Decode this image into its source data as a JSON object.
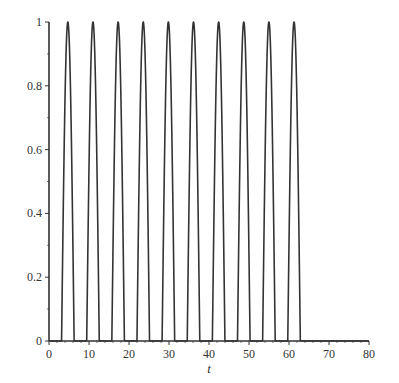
{
  "chart_data": {
    "type": "line",
    "title": "",
    "xlabel": "t",
    "ylabel": "",
    "xlim": [
      0,
      80
    ],
    "ylim": [
      0,
      1
    ],
    "x_ticks": [
      0,
      10,
      20,
      30,
      40,
      50,
      60,
      70,
      80
    ],
    "x_tick_labels": [
      "0",
      "10",
      "20",
      "30",
      "40",
      "50",
      "60",
      "70",
      "80"
    ],
    "y_ticks": [
      0,
      0.2,
      0.4,
      0.6,
      0.8,
      1
    ],
    "y_tick_labels": [
      "0",
      "0.2",
      "0.4",
      "0.6",
      "0.8",
      "1"
    ],
    "grid": false,
    "legend": null,
    "series": [
      {
        "name": "pulse train",
        "description": "max(0, -sin(t)) for 0 <= t <= 20*pi, then 0 up to t = 80",
        "color": "#333333",
        "peaks_x": [
          4.71,
          10.99,
          17.28,
          23.56,
          29.85,
          36.13,
          42.41,
          48.69,
          54.98,
          61.26
        ],
        "peaks_y": [
          1,
          1,
          1,
          1,
          1,
          1,
          1,
          1,
          1,
          1
        ],
        "pulse_count": 10,
        "pulse_end_t": 62.83,
        "baseline_value": 0
      }
    ],
    "axis_color": "#333333"
  }
}
